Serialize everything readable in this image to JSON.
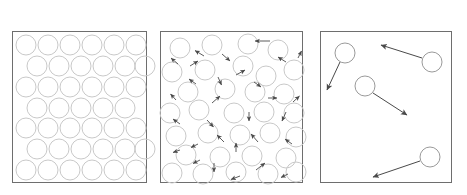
{
  "figure": {
    "name": "states-of-matter-particle-diagram",
    "width": 467,
    "height": 195,
    "background": "#ffffff",
    "box_stroke": "#6e6e6e",
    "circle_stroke_light": "#c9c9c9",
    "circle_stroke_dark": "#9a9a9a",
    "arrow_color": "#4a4a4a",
    "title_color": "#1c1c1c"
  },
  "panels": [
    {
      "id": "solid",
      "title": "solid",
      "box": {
        "x": 12,
        "y": 31,
        "w": 134,
        "h": 151
      },
      "particle_radius": 10,
      "arrow_count": 0,
      "description": "closely packed regular staggered array of particles, no motion arrows",
      "circles": [
        {
          "cx": 26,
          "cy": 45
        },
        {
          "cx": 48,
          "cy": 45
        },
        {
          "cx": 70,
          "cy": 45
        },
        {
          "cx": 92,
          "cy": 45
        },
        {
          "cx": 114,
          "cy": 45
        },
        {
          "cx": 136,
          "cy": 45
        },
        {
          "cx": 37,
          "cy": 66
        },
        {
          "cx": 59,
          "cy": 66
        },
        {
          "cx": 81,
          "cy": 66
        },
        {
          "cx": 103,
          "cy": 66
        },
        {
          "cx": 125,
          "cy": 66
        },
        {
          "cx": 147,
          "cy": 66
        },
        {
          "cx": 26,
          "cy": 87
        },
        {
          "cx": 48,
          "cy": 87
        },
        {
          "cx": 70,
          "cy": 87
        },
        {
          "cx": 92,
          "cy": 87
        },
        {
          "cx": 114,
          "cy": 87
        },
        {
          "cx": 136,
          "cy": 87
        },
        {
          "cx": 37,
          "cy": 108
        },
        {
          "cx": 59,
          "cy": 108
        },
        {
          "cx": 81,
          "cy": 108
        },
        {
          "cx": 103,
          "cy": 108
        },
        {
          "cx": 125,
          "cy": 108
        },
        {
          "cx": 26,
          "cy": 128
        },
        {
          "cx": 48,
          "cy": 128
        },
        {
          "cx": 70,
          "cy": 128
        },
        {
          "cx": 92,
          "cy": 128
        },
        {
          "cx": 114,
          "cy": 128
        },
        {
          "cx": 136,
          "cy": 128
        },
        {
          "cx": 37,
          "cy": 149
        },
        {
          "cx": 59,
          "cy": 149
        },
        {
          "cx": 81,
          "cy": 149
        },
        {
          "cx": 103,
          "cy": 149
        },
        {
          "cx": 125,
          "cy": 149
        },
        {
          "cx": 147,
          "cy": 149
        },
        {
          "cx": 26,
          "cy": 170
        },
        {
          "cx": 48,
          "cy": 170
        },
        {
          "cx": 70,
          "cy": 170
        },
        {
          "cx": 92,
          "cy": 170
        },
        {
          "cx": 114,
          "cy": 170
        },
        {
          "cx": 136,
          "cy": 170
        }
      ],
      "arrows": []
    },
    {
      "id": "liquid",
      "title": "liquid",
      "box": {
        "x": 160,
        "y": 31,
        "w": 143,
        "h": 151
      },
      "particle_radius": 10,
      "arrow_count": 29,
      "description": "randomly arranged particles in contact, short motion arrows in many directions",
      "circles": [
        {
          "cx": 180,
          "cy": 48
        },
        {
          "cx": 212,
          "cy": 45
        },
        {
          "cx": 248,
          "cy": 44
        },
        {
          "cx": 278,
          "cy": 50
        },
        {
          "cx": 172,
          "cy": 72
        },
        {
          "cx": 205,
          "cy": 70
        },
        {
          "cx": 243,
          "cy": 66
        },
        {
          "cx": 266,
          "cy": 76
        },
        {
          "cx": 294,
          "cy": 70
        },
        {
          "cx": 188,
          "cy": 92
        },
        {
          "cx": 225,
          "cy": 89
        },
        {
          "cx": 255,
          "cy": 92
        },
        {
          "cx": 284,
          "cy": 94
        },
        {
          "cx": 170,
          "cy": 113
        },
        {
          "cx": 199,
          "cy": 110
        },
        {
          "cx": 234,
          "cy": 113
        },
        {
          "cx": 264,
          "cy": 112
        },
        {
          "cx": 296,
          "cy": 113
        },
        {
          "cx": 176,
          "cy": 136
        },
        {
          "cx": 208,
          "cy": 133
        },
        {
          "cx": 240,
          "cy": 135
        },
        {
          "cx": 270,
          "cy": 133
        },
        {
          "cx": 298,
          "cy": 137
        },
        {
          "cx": 186,
          "cy": 155
        },
        {
          "cx": 220,
          "cy": 157
        },
        {
          "cx": 252,
          "cy": 156
        },
        {
          "cx": 286,
          "cy": 158
        },
        {
          "cx": 172,
          "cy": 173
        },
        {
          "cx": 203,
          "cy": 174
        },
        {
          "cx": 236,
          "cy": 172
        },
        {
          "cx": 268,
          "cy": 174
        },
        {
          "cx": 297,
          "cy": 172
        }
      ],
      "arrows": [
        {
          "x1": 270,
          "y1": 41,
          "x2": 253,
          "y2": 41
        },
        {
          "x1": 204,
          "y1": 56,
          "x2": 194,
          "y2": 50
        },
        {
          "x1": 178,
          "y1": 64,
          "x2": 170,
          "y2": 57
        },
        {
          "x1": 222,
          "y1": 54,
          "x2": 231,
          "y2": 62
        },
        {
          "x1": 286,
          "y1": 62,
          "x2": 277,
          "y2": 56
        },
        {
          "x1": 298,
          "y1": 58,
          "x2": 302,
          "y2": 50
        },
        {
          "x1": 190,
          "y1": 66,
          "x2": 199,
          "y2": 60
        },
        {
          "x1": 236,
          "y1": 75,
          "x2": 246,
          "y2": 69
        },
        {
          "x1": 254,
          "y1": 82,
          "x2": 262,
          "y2": 88
        },
        {
          "x1": 218,
          "y1": 77,
          "x2": 222,
          "y2": 86
        },
        {
          "x1": 196,
          "y1": 84,
          "x2": 188,
          "y2": 78
        },
        {
          "x1": 212,
          "y1": 103,
          "x2": 221,
          "y2": 95
        },
        {
          "x1": 268,
          "y1": 98,
          "x2": 278,
          "y2": 98
        },
        {
          "x1": 293,
          "y1": 102,
          "x2": 300,
          "y2": 95
        },
        {
          "x1": 176,
          "y1": 100,
          "x2": 170,
          "y2": 93
        },
        {
          "x1": 180,
          "y1": 124,
          "x2": 172,
          "y2": 118
        },
        {
          "x1": 207,
          "y1": 120,
          "x2": 214,
          "y2": 128
        },
        {
          "x1": 249,
          "y1": 112,
          "x2": 249,
          "y2": 122
        },
        {
          "x1": 286,
          "y1": 112,
          "x2": 281,
          "y2": 122
        },
        {
          "x1": 224,
          "y1": 142,
          "x2": 216,
          "y2": 134
        },
        {
          "x1": 258,
          "y1": 142,
          "x2": 250,
          "y2": 133
        },
        {
          "x1": 292,
          "y1": 144,
          "x2": 284,
          "y2": 138
        },
        {
          "x1": 198,
          "y1": 144,
          "x2": 190,
          "y2": 148
        },
        {
          "x1": 180,
          "y1": 150,
          "x2": 172,
          "y2": 153
        },
        {
          "x1": 236,
          "y1": 152,
          "x2": 236,
          "y2": 142
        },
        {
          "x1": 200,
          "y1": 160,
          "x2": 192,
          "y2": 164
        },
        {
          "x1": 214,
          "y1": 163,
          "x2": 214,
          "y2": 173
        },
        {
          "x1": 256,
          "y1": 170,
          "x2": 266,
          "y2": 162
        },
        {
          "x1": 240,
          "y1": 176,
          "x2": 230,
          "y2": 180
        },
        {
          "x1": 288,
          "y1": 174,
          "x2": 280,
          "y2": 178
        }
      ]
    },
    {
      "id": "gas",
      "title": "gas",
      "box": {
        "x": 320,
        "y": 31,
        "w": 132,
        "h": 151
      },
      "particle_radius": 10,
      "arrow_count": 4,
      "description": "few widely separated particles with long straight motion arrows",
      "circles": [
        {
          "cx": 345,
          "cy": 53
        },
        {
          "cx": 432,
          "cy": 62
        },
        {
          "cx": 365,
          "cy": 86
        },
        {
          "cx": 430,
          "cy": 157
        }
      ],
      "arrows": [
        {
          "x1": 340,
          "y1": 63,
          "x2": 326,
          "y2": 91
        },
        {
          "x1": 422,
          "y1": 58,
          "x2": 380,
          "y2": 45
        },
        {
          "x1": 374,
          "y1": 93,
          "x2": 408,
          "y2": 116
        },
        {
          "x1": 420,
          "y1": 161,
          "x2": 372,
          "y2": 177
        }
      ]
    }
  ]
}
